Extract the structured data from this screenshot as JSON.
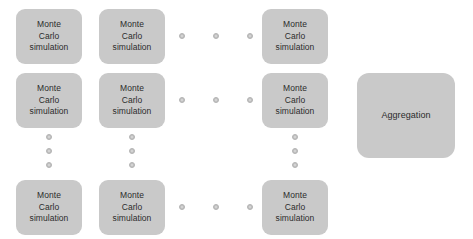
{
  "diagram": {
    "type": "flow-grid",
    "canvas": {
      "width": 473,
      "height": 239
    },
    "colors": {
      "node_fill": "#c9c9c9",
      "node_text": "#2b2b2b",
      "dot_fill": "#c2c2c2",
      "background": "#ffffff"
    },
    "node_label": "Monte\nCarlo\nsimulation",
    "aggregation_label": "Aggregation",
    "simulation_nodes": [
      {
        "id": "sim-r1c1",
        "label": "Monte\nCarlo\nsimulation",
        "x": 16,
        "y": 9,
        "row": 1,
        "col": 1
      },
      {
        "id": "sim-r1c2",
        "label": "Monte\nCarlo\nsimulation",
        "x": 99,
        "y": 9,
        "row": 1,
        "col": 2
      },
      {
        "id": "sim-r1c3",
        "label": "Monte\nCarlo\nsimulation",
        "x": 262,
        "y": 9,
        "row": 1,
        "col": 3
      },
      {
        "id": "sim-r2c1",
        "label": "Monte\nCarlo\nsimulation",
        "x": 16,
        "y": 73,
        "row": 2,
        "col": 1
      },
      {
        "id": "sim-r2c2",
        "label": "Monte\nCarlo\nsimulation",
        "x": 99,
        "y": 73,
        "row": 2,
        "col": 2
      },
      {
        "id": "sim-r2c3",
        "label": "Monte\nCarlo\nsimulation",
        "x": 262,
        "y": 73,
        "row": 2,
        "col": 3
      },
      {
        "id": "sim-r4c1",
        "label": "Monte\nCarlo\nsimulation",
        "x": 16,
        "y": 180,
        "row": 4,
        "col": 1
      },
      {
        "id": "sim-r4c2",
        "label": "Monte\nCarlo\nsimulation",
        "x": 99,
        "y": 180,
        "row": 4,
        "col": 2
      },
      {
        "id": "sim-r4c3",
        "label": "Monte\nCarlo\nsimulation",
        "x": 262,
        "y": 180,
        "row": 4,
        "col": 3
      }
    ],
    "aggregation_node": {
      "id": "aggregation",
      "label": "Aggregation",
      "x": 357,
      "y": 73
    },
    "ellipsis_dots": [
      {
        "id": "h-r1-1",
        "x": 179,
        "y": 33,
        "orientation": "horizontal",
        "row": 1
      },
      {
        "id": "h-r1-2",
        "x": 213,
        "y": 33,
        "orientation": "horizontal",
        "row": 1
      },
      {
        "id": "h-r1-3",
        "x": 247,
        "y": 33,
        "orientation": "horizontal",
        "row": 1
      },
      {
        "id": "h-r2-1",
        "x": 179,
        "y": 97,
        "orientation": "horizontal",
        "row": 2
      },
      {
        "id": "h-r2-2",
        "x": 213,
        "y": 97,
        "orientation": "horizontal",
        "row": 2
      },
      {
        "id": "h-r2-3",
        "x": 247,
        "y": 97,
        "orientation": "horizontal",
        "row": 2
      },
      {
        "id": "h-r4-1",
        "x": 179,
        "y": 204,
        "orientation": "horizontal",
        "row": 4
      },
      {
        "id": "h-r4-2",
        "x": 213,
        "y": 204,
        "orientation": "horizontal",
        "row": 4
      },
      {
        "id": "h-r4-3",
        "x": 247,
        "y": 204,
        "orientation": "horizontal",
        "row": 4
      },
      {
        "id": "v-c1-1",
        "x": 46,
        "y": 134,
        "orientation": "vertical",
        "col": 1
      },
      {
        "id": "v-c1-2",
        "x": 46,
        "y": 148,
        "orientation": "vertical",
        "col": 1
      },
      {
        "id": "v-c1-3",
        "x": 46,
        "y": 162,
        "orientation": "vertical",
        "col": 1
      },
      {
        "id": "v-c2-1",
        "x": 129,
        "y": 134,
        "orientation": "vertical",
        "col": 2
      },
      {
        "id": "v-c2-2",
        "x": 129,
        "y": 148,
        "orientation": "vertical",
        "col": 2
      },
      {
        "id": "v-c2-3",
        "x": 129,
        "y": 162,
        "orientation": "vertical",
        "col": 2
      },
      {
        "id": "v-c3-1",
        "x": 292,
        "y": 134,
        "orientation": "vertical",
        "col": 3
      },
      {
        "id": "v-c3-2",
        "x": 292,
        "y": 148,
        "orientation": "vertical",
        "col": 3
      },
      {
        "id": "v-c3-3",
        "x": 292,
        "y": 162,
        "orientation": "vertical",
        "col": 3
      }
    ]
  }
}
